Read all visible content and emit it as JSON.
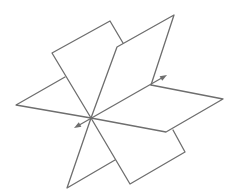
{
  "diagram": {
    "stroke_color": "#6e6e6e",
    "background": "#ffffff",
    "center": [
      91,
      118
    ],
    "planes": [
      {
        "name": "horizontal-plane",
        "polylines": [
          [
            [
              65,
              77
            ],
            [
              16,
              105
            ],
            [
              91,
              118
            ]
          ],
          [
            [
              151,
              85
            ],
            [
              223,
              99
            ],
            [
              166,
              132
            ],
            [
              91,
              118
            ]
          ]
        ]
      },
      {
        "name": "steep-plane",
        "polylines": [
          [
            [
              91,
              118
            ],
            [
              52,
              53
            ],
            [
              110,
              21
            ],
            [
              123,
              43
            ]
          ],
          [
            [
              91,
              118
            ],
            [
              130,
              184
            ],
            [
              185,
              152
            ],
            [
              173,
              130
            ]
          ]
        ]
      },
      {
        "name": "upright-plane",
        "polylines": [
          [
            [
              91,
              118
            ],
            [
              117,
              47
            ],
            [
              174,
              15
            ],
            [
              151,
              85
            ]
          ],
          [
            [
              91,
              118
            ],
            [
              67,
              188
            ],
            [
              115,
              160
            ]
          ]
        ]
      }
    ],
    "axis": {
      "from": [
        74,
        128
      ],
      "to": [
        167,
        75
      ]
    }
  }
}
